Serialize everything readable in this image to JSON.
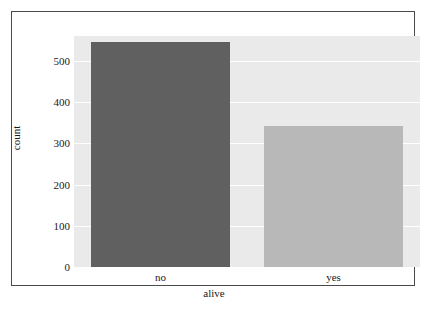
{
  "chart_data": {
    "type": "bar",
    "title": "",
    "xlabel": "alive",
    "ylabel": "count",
    "categories": [
      "no",
      "yes"
    ],
    "values": [
      545,
      342
    ],
    "series": [
      {
        "name": "count",
        "values": [
          545,
          342
        ]
      }
    ],
    "ylim": [
      0,
      560
    ],
    "yticks": [
      0,
      100,
      200,
      300,
      400,
      500
    ],
    "ytick_labels": [
      "0",
      "100",
      "200",
      "300",
      "400",
      "500"
    ],
    "grid": true,
    "grid_axis": "y",
    "legend": false,
    "bar_colors": [
      "#606060",
      "#b8b8b8"
    ],
    "plot_background": "#eaeaea",
    "gridline_color": "#ffffff",
    "frame_color": "#4a4a4a",
    "text_color": "#1a1a1a"
  }
}
